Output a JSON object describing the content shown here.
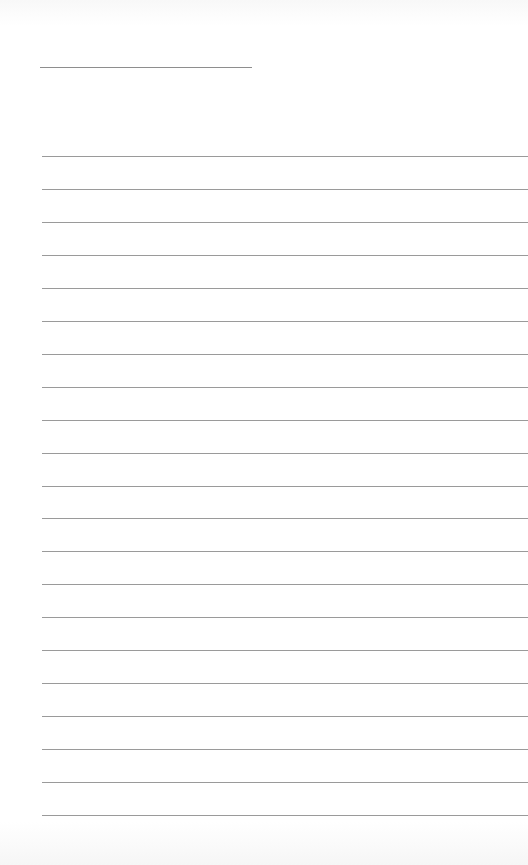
{
  "document": {
    "type": "lined-paper",
    "title_field": {
      "value": ""
    },
    "lines_count": 21,
    "lines": [
      "",
      "",
      "",
      "",
      "",
      "",
      "",
      "",
      "",
      "",
      "",
      "",
      "",
      "",
      "",
      "",
      "",
      "",
      "",
      "",
      ""
    ]
  }
}
